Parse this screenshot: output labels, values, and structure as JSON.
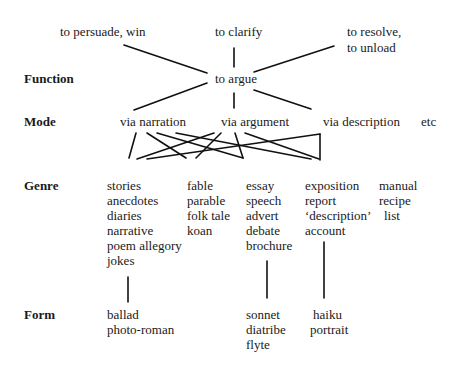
{
  "levels": {
    "function": "Function",
    "mode": "Mode",
    "genre": "Genre",
    "form": "Form"
  },
  "purposes": {
    "persuade": "to persuade, win",
    "clarify": "to clarify",
    "resolve_line1": "to resolve,",
    "resolve_line2": "to unload"
  },
  "function_node": "to argue",
  "modes": {
    "narration": "via narration",
    "argument": "via argument",
    "description": "via description",
    "etc": "etc"
  },
  "genres": {
    "col1": [
      "stories",
      "anecdotes",
      "diaries",
      "narrative",
      "poem allegory",
      "jokes"
    ],
    "col2": [
      "fable",
      "parable",
      "folk tale",
      "koan"
    ],
    "col3": [
      "essay",
      "speech",
      "advert",
      "debate",
      "brochure"
    ],
    "col4": [
      "exposition",
      "report",
      "‘description’",
      "account"
    ],
    "col5": [
      "manual",
      "recipe",
      "list"
    ]
  },
  "forms": {
    "col1": [
      "ballad",
      "photo-roman"
    ],
    "col3": [
      "sonnet",
      "diatribe",
      "flyte"
    ],
    "col4": [
      "haiku",
      "portrait"
    ]
  }
}
